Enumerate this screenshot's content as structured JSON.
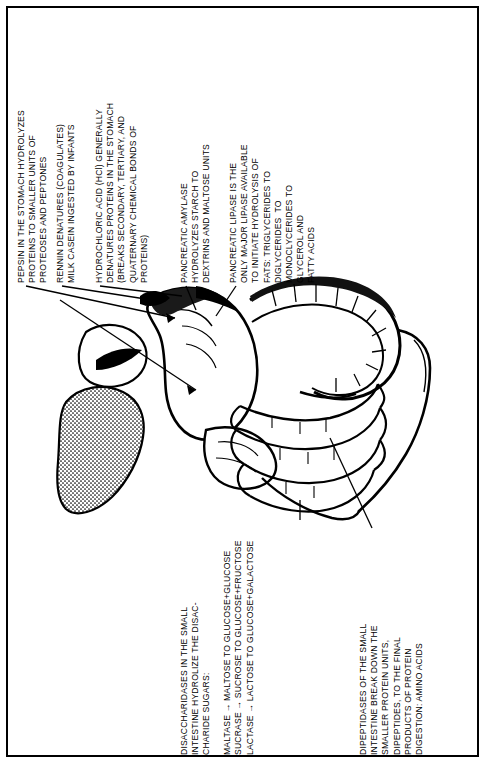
{
  "document": {
    "type": "anatomical-diagram",
    "subject": "Chemical digestion in the stomach and small intestine",
    "background_color": "#ffffff",
    "ink_color": "#000000",
    "border_color": "#000000"
  },
  "captions": {
    "pepsin": {
      "name": "pepsin-caption",
      "lines": [
        "PEPSIN IN THE STOMACH HYDROLYZES",
        "PROTEINS TO SMALLER UNITS OF",
        "PROTEOSES AND PEPTONES"
      ],
      "text": "PEPSIN IN THE STOMACH HYDROLYZES\nPROTEINS TO SMALLER UNITS OF\nPROTEOSES AND PEPTONES"
    },
    "rennin": {
      "name": "rennin-caption",
      "lines": [
        "RENNIN DENATURES (COAGULATES)",
        "MILK CASEIN INGESTED BY INFANTS"
      ],
      "text": "RENNIN DENATURES (COAGULATES)\nMILK CASEIN INGESTED BY INFANTS"
    },
    "hydrochloric_acid": {
      "name": "hydrochloric-acid-caption",
      "lines": [
        "HYDROCHLORIC ACID (HCl) GENERALLY",
        "DENATURES PROTEINS IN THE STOMACH",
        "(BREAKS SECONDARY, TERTIARY, AND",
        "QUATERNARY CHEMICAL BONDS OF",
        "PROTEINS)"
      ],
      "text": "HYDROCHLORIC ACID (HCl) GENERALLY\nDENATURES PROTEINS IN THE STOMACH\n(BREAKS SECONDARY, TERTIARY, AND\nQUATERNARY CHEMICAL BONDS OF\nPROTEINS)"
    },
    "pancreatic_amylase": {
      "name": "pancreatic-amylase-caption",
      "lines": [
        "PANCREATIC AMYLASE",
        "HYDROLYZES STARCH TO",
        "DEXTRINS AND MALTOSE UNITS"
      ],
      "text": "PANCREATIC AMYLASE\nHYDROLYZES STARCH TO\nDEXTRINS AND MALTOSE UNITS"
    },
    "pancreatic_lipase": {
      "name": "pancreatic-lipase-caption",
      "lines": [
        "PANCREATIC LIPASE IS THE",
        "ONLY MAJOR LIPASE AVAILABLE",
        "TO INITIATE HYDROLYSIS OF",
        "FATS: TRIGLYCERIDES TO",
        "DIGLYCERIDES  TO",
        "MONOCLYCERIDES TO",
        "GLYCEROL AND",
        "FATTY ACIDS"
      ],
      "text": "PANCREATIC LIPASE IS THE\nONLY MAJOR LIPASE AVAILABLE\nTO INITIATE HYDROLYSIS OF\nFATS: TRIGLYCERIDES TO\nDIGLYCERIDES  TO\nMONOCLYCERIDES TO\nGLYCEROL AND\nFATTY ACIDS"
    },
    "disaccharidases": {
      "name": "disaccharidases-caption",
      "lines": [
        "DISACCHARIDASES IN THE SMALL",
        "INTESTINE HYDROLIZE THE DISAC-",
        "CHARIDE SUGARS:"
      ],
      "text": "DISACCHARIDASES IN THE SMALL\nINTESTINE HYDROLIZE THE DISAC-\nCHARIDE SUGARS:"
    },
    "sugar_reactions": {
      "name": "sugar-reactions-caption",
      "lines": [
        "MALTASE → MALTOSE TO GLUCOSE+GLUCOSE",
        "SUCRASE → SUCROSE TO GLUCOSE+FRUCTOSE",
        "LACTASE → LACTOSE TO GLUCOSE+GALACTOSE"
      ],
      "text": "MALTASE → MALTOSE TO GLUCOSE+GLUCOSE\nSUCRASE → SUCROSE TO GLUCOSE+FRUCTOSE\nLACTASE → LACTOSE TO GLUCOSE+GALACTOSE"
    },
    "dipeptidases": {
      "name": "dipeptidases-caption",
      "lines": [
        "DIPEPTIDASES OF THE SMALL",
        "INTESTINE BREAK DOWN THE",
        "SMALLER PROTEIN UNITS,",
        "DIPEPTIDES, TO THE FINAL",
        "PRODUCTS OF PROTEIN",
        "DIGESTION: AMINO ACIDS"
      ],
      "text": "DIPEPTIDASES OF THE SMALL\nINTESTINE BREAK DOWN THE\nSMALLER PROTEIN UNITS,\nDIPEPTIDES, TO THE FINAL\nPRODUCTS OF PROTEIN\nDIGESTION: AMINO ACIDS"
    }
  },
  "illustration": {
    "name": "digestive-tract-illustration",
    "parts": [
      "liver",
      "stomach",
      "duodenum",
      "pancreas",
      "small-intestine",
      "large-intestine"
    ]
  }
}
